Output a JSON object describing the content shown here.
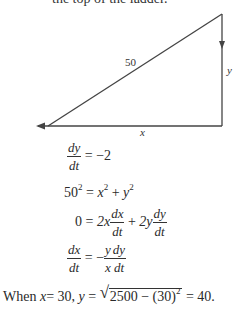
{
  "header_fragment": "the top of the ladder.",
  "diagram": {
    "hypotenuse_label": "50",
    "vertical_label": "y",
    "horizontal_label": "x",
    "vertices": {
      "top_right": [
        222,
        14
      ],
      "bottom_right": [
        222,
        126
      ],
      "bottom_left": [
        48,
        126
      ]
    },
    "arrows": [
      {
        "on": "vertical side",
        "direction": "down"
      },
      {
        "on": "horizontal side",
        "direction": "left"
      }
    ]
  },
  "equations": {
    "eq1": {
      "num": "dy",
      "den": "dt",
      "rhs": "= −2"
    },
    "eq2": {
      "lhs": "50",
      "lhs_exp": "2",
      "eq": "=",
      "x": "x",
      "x_exp": "2",
      "plus": "+",
      "y": "y",
      "y_exp": "2"
    },
    "eq3": {
      "lhs": "0",
      "eq": "=",
      "t1_coef": "2x",
      "t1_num": "dx",
      "t1_den": "dt",
      "plus": "+",
      "t2_coef": "2y",
      "t2_num": "dy",
      "t2_den": "dt"
    },
    "eq4": {
      "num": "dx",
      "den": "dt",
      "eq": "= −",
      "f1_num": "y",
      "f1_den": "x",
      "f2_num": "dy",
      "f2_den": "dt"
    }
  },
  "conclusion": {
    "when": "When",
    "x_part": "x",
    "x_eq": "= 30,",
    "y_part": "y",
    "y_eq": "=",
    "radicand_a": "2500 − (30)",
    "radicand_exp": "2",
    "result": "= 40."
  }
}
